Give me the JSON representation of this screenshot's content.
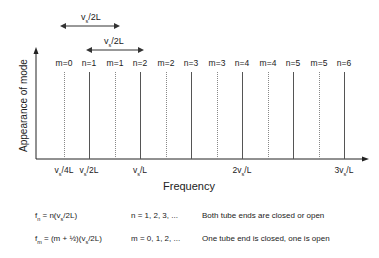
{
  "diagram": {
    "y_axis_label": "Appearance of mode",
    "x_axis_label": "Frequency",
    "spacing_arrows": [
      {
        "label": "v_s/2L",
        "from": "m=0",
        "to": "m=1"
      },
      {
        "label": "v_s/2L",
        "from": "n=1",
        "to": "n=2"
      }
    ],
    "modes": [
      {
        "label": "m=0",
        "x": 64,
        "style": "dashed"
      },
      {
        "label": "n=1",
        "x": 89,
        "style": "solid"
      },
      {
        "label": "m=1",
        "x": 115,
        "style": "dashed"
      },
      {
        "label": "n=2",
        "x": 140,
        "style": "solid"
      },
      {
        "label": "m=2",
        "x": 166,
        "style": "dashed"
      },
      {
        "label": "n=3",
        "x": 191,
        "style": "solid"
      },
      {
        "label": "m=3",
        "x": 217,
        "style": "dashed"
      },
      {
        "label": "n=4",
        "x": 242,
        "style": "solid"
      },
      {
        "label": "m=4",
        "x": 268,
        "style": "dashed"
      },
      {
        "label": "n=5",
        "x": 293,
        "style": "solid"
      },
      {
        "label": "m=5",
        "x": 319,
        "style": "dashed"
      },
      {
        "label": "n=6",
        "x": 344,
        "style": "solid"
      }
    ],
    "x_ticks": [
      {
        "label": "v_s/4L",
        "x": 64
      },
      {
        "label": "v_s/2L",
        "x": 89
      },
      {
        "label": "v_s/L",
        "x": 140
      },
      {
        "label": "2v_s/L",
        "x": 242
      },
      {
        "label": "3v_s/L",
        "x": 344
      }
    ],
    "equations": [
      {
        "formula": "f_n = n(v_s/2L)",
        "range": "n = 1, 2, 3, ...",
        "description": "Both tube ends are closed or open"
      },
      {
        "formula": "f_m = (m + ½)(v_s/2L)",
        "range": "m = 0, 1, 2, ...",
        "description": "One tube end is closed, one is open"
      }
    ]
  }
}
